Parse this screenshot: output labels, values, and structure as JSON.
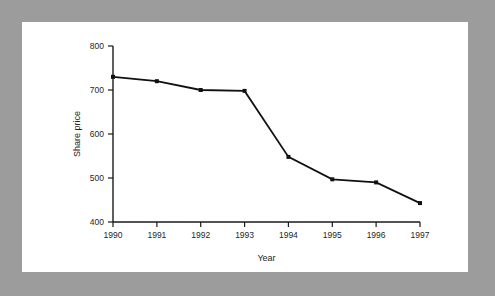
{
  "figure": {
    "background_color": "#9c9c9c",
    "canvas_color": "#ffffff"
  },
  "chart_data": {
    "type": "line",
    "title": "",
    "subtitle": "",
    "xlabel": "Year",
    "ylabel": "Share price",
    "x": [
      1990,
      1991,
      1992,
      1993,
      1994,
      1995,
      1996,
      1997
    ],
    "categories": [
      "1990",
      "1991",
      "1992",
      "1993",
      "1994",
      "1995",
      "1996",
      "1997"
    ],
    "values": [
      730,
      720,
      700,
      698,
      548,
      497,
      490,
      443
    ],
    "series": [
      {
        "name": "Share price",
        "values": [
          730,
          720,
          700,
          698,
          548,
          497,
          490,
          443
        ],
        "color": "#111111",
        "marker": "square"
      }
    ],
    "xlim": [
      1990,
      1997
    ],
    "ylim": [
      400,
      800
    ],
    "xticks": [
      1990,
      1991,
      1992,
      1993,
      1994,
      1995,
      1996,
      1997
    ],
    "xtick_labels": [
      "1990",
      "1991",
      "1992",
      "1993",
      "1994",
      "1995",
      "1996",
      "1997"
    ],
    "yticks": [
      400,
      500,
      600,
      700,
      800
    ],
    "ytick_labels": [
      "400",
      "500",
      "600",
      "700",
      "800"
    ],
    "grid": false,
    "legend": false,
    "legend_position": "none",
    "annotations": []
  }
}
